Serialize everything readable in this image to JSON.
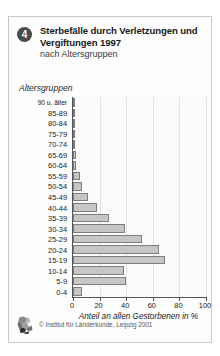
{
  "header": {
    "badge_number": "4",
    "title": "Sterbefälle durch Verletzungen und Vergiftungen 1997",
    "subtitle": "nach Altersgruppen"
  },
  "footer": {
    "credit": "© Institut für Länderkunde, Leipzig 2001",
    "logo_icon": "ifl-logo-icon"
  },
  "colors": {
    "bar_fill": "#c6c6c6",
    "bar_border": "#7d7d7d",
    "badge_bg": "#4a4a4a",
    "grid": "#e2e2e2",
    "axis": "#555555",
    "frame": "#c9c9c9"
  },
  "chart_data": {
    "type": "bar",
    "orientation": "horizontal",
    "title": "Sterbefälle durch Verletzungen und Vergiftungen 1997",
    "subtitle": "nach Altersgruppen",
    "xlabel": "Anteil an allen Gestorbenen in %",
    "ylabel": "Altersgruppen",
    "xlim": [
      0,
      100
    ],
    "xticks": [
      0,
      20,
      40,
      60,
      80,
      100
    ],
    "xticklabels": [
      "0",
      "20",
      "40",
      "60",
      "80",
      "100"
    ],
    "grid": true,
    "legend": null,
    "categories": [
      "90 u. älter",
      "85-89",
      "80-84",
      "75-79",
      "70-74",
      "65-69",
      "60-64",
      "55-59",
      "50-54",
      "45-49",
      "40-44",
      "35-39",
      "30-34",
      "25-29",
      "20-24",
      "15-19",
      "10-14",
      "5-9",
      "0-4"
    ],
    "values": [
      1,
      1,
      1,
      1,
      1.5,
      2,
      2.5,
      5,
      7,
      11,
      18,
      27,
      39,
      52,
      65,
      69,
      38,
      40,
      7
    ]
  }
}
